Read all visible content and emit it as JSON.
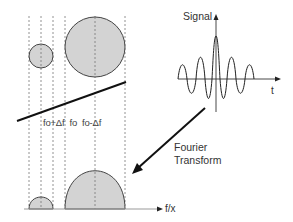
{
  "diagram": {
    "labels": {
      "signal": "Signal",
      "time_axis": "t",
      "freq_axis": "f/x",
      "fourier_line1": "Fourier",
      "fourier_line2": "Transform",
      "freq_plus": "fo+Δf",
      "freq_center": "fo",
      "freq_minus": "fo-Δf"
    },
    "colors": {
      "fill": "#d3d3d3",
      "stroke": "#333333",
      "dashed": "#777777",
      "background": "#ffffff"
    },
    "elements": {
      "dashed_lines_x": [
        29,
        41,
        53,
        65,
        95,
        125
      ],
      "small_circle": {
        "cx": 41,
        "cy": 56,
        "r": 12
      },
      "large_circle": {
        "cx": 95,
        "cy": 47,
        "r": 30
      },
      "small_peak": {
        "x_start": 29,
        "x_end": 53,
        "peak_y": 197
      },
      "large_peak": {
        "x_start": 65,
        "x_end": 125,
        "peak_y": 172
      },
      "baseline_y": 209
    }
  }
}
